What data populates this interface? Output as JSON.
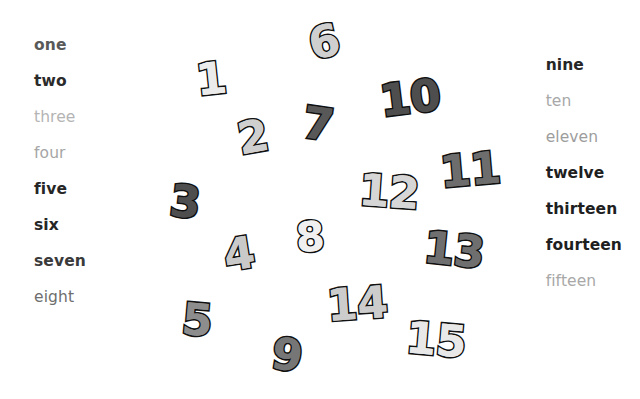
{
  "canvas": {
    "width": 640,
    "height": 399,
    "background": "#ffffff"
  },
  "left_column": {
    "name": "number-words-left",
    "items": [
      {
        "label": "one",
        "color": "#595959",
        "weight": "bold"
      },
      {
        "label": "two",
        "color": "#2b2b2b",
        "weight": "bold"
      },
      {
        "label": "three",
        "color": "#b4b4b4",
        "weight": "normal"
      },
      {
        "label": "four",
        "color": "#a6a6a6",
        "weight": "normal"
      },
      {
        "label": "five",
        "color": "#262626",
        "weight": "bold"
      },
      {
        "label": "six",
        "color": "#262626",
        "weight": "bold"
      },
      {
        "label": "seven",
        "color": "#3a3a3a",
        "weight": "bold"
      },
      {
        "label": "eight",
        "color": "#6e6e6e",
        "weight": "normal"
      }
    ]
  },
  "right_column": {
    "name": "number-words-right",
    "items": [
      {
        "label": "nine",
        "color": "#262626",
        "weight": "bold"
      },
      {
        "label": "ten",
        "color": "#a8a8a8",
        "weight": "normal"
      },
      {
        "label": "eleven",
        "color": "#9d9d9d",
        "weight": "normal"
      },
      {
        "label": "twelve",
        "color": "#1f1f1f",
        "weight": "bold"
      },
      {
        "label": "thirteen",
        "color": "#1f1f1f",
        "weight": "bold"
      },
      {
        "label": "fourteen",
        "color": "#1f1f1f",
        "weight": "bold"
      },
      {
        "label": "fifteen",
        "color": "#a8a8a8",
        "weight": "normal"
      }
    ]
  },
  "numbers": [
    {
      "label": "1",
      "x": 196,
      "y": 57,
      "size": 44,
      "fill": "#ebebeb",
      "rotate": -6
    },
    {
      "label": "2",
      "x": 238,
      "y": 115,
      "size": 44,
      "fill": "#cfcfcf",
      "rotate": -10
    },
    {
      "label": "3",
      "x": 170,
      "y": 180,
      "size": 44,
      "fill": "#4e4e4e",
      "rotate": 6
    },
    {
      "label": "4",
      "x": 224,
      "y": 232,
      "size": 44,
      "fill": "#c9c9c9",
      "rotate": -9
    },
    {
      "label": "5",
      "x": 182,
      "y": 298,
      "size": 44,
      "fill": "#8d8d8d",
      "rotate": 5
    },
    {
      "label": "6",
      "x": 309,
      "y": 20,
      "size": 44,
      "fill": "#cfcfcf",
      "rotate": -13
    },
    {
      "label": "7",
      "x": 303,
      "y": 102,
      "size": 44,
      "fill": "#585858",
      "rotate": 8
    },
    {
      "label": "8",
      "x": 296,
      "y": 217,
      "size": 41,
      "fill": "#f0f0f0",
      "rotate": -4
    },
    {
      "label": "9",
      "x": 272,
      "y": 333,
      "size": 44,
      "fill": "#767676",
      "rotate": 9
    },
    {
      "label": "10",
      "x": 380,
      "y": 76,
      "size": 44,
      "fill": "#4e4e4e",
      "rotate": -7
    },
    {
      "label": "11",
      "x": 440,
      "y": 148,
      "size": 44,
      "fill": "#6d6d6d",
      "rotate": -5
    },
    {
      "label": "12",
      "x": 359,
      "y": 170,
      "size": 44,
      "fill": "#d6d6d6",
      "rotate": 4
    },
    {
      "label": "13",
      "x": 424,
      "y": 228,
      "size": 44,
      "fill": "#6f6f6f",
      "rotate": 6
    },
    {
      "label": "14",
      "x": 327,
      "y": 282,
      "size": 44,
      "fill": "#cccccc",
      "rotate": -4
    },
    {
      "label": "15",
      "x": 406,
      "y": 318,
      "size": 44,
      "fill": "#e8e8e8",
      "rotate": 5
    }
  ]
}
